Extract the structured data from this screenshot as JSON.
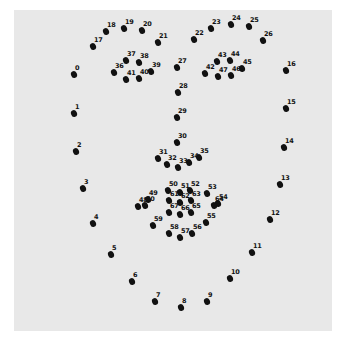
{
  "figure": {
    "background_color": "#ffffff",
    "panel_color": "#e8e8e8",
    "point_color": "#111111"
  },
  "landmarks": [
    {
      "id": "0",
      "x": 74,
      "y": 74
    },
    {
      "id": "1",
      "x": 74,
      "y": 113
    },
    {
      "id": "2",
      "x": 76,
      "y": 151
    },
    {
      "id": "3",
      "x": 83,
      "y": 188
    },
    {
      "id": "4",
      "x": 93,
      "y": 223
    },
    {
      "id": "5",
      "x": 111,
      "y": 254
    },
    {
      "id": "6",
      "x": 132,
      "y": 281
    },
    {
      "id": "7",
      "x": 155,
      "y": 301
    },
    {
      "id": "8",
      "x": 181,
      "y": 307
    },
    {
      "id": "9",
      "x": 207,
      "y": 301
    },
    {
      "id": "10",
      "x": 230,
      "y": 278
    },
    {
      "id": "11",
      "x": 252,
      "y": 252
    },
    {
      "id": "12",
      "x": 270,
      "y": 219
    },
    {
      "id": "13",
      "x": 280,
      "y": 184
    },
    {
      "id": "14",
      "x": 284,
      "y": 147
    },
    {
      "id": "15",
      "x": 286,
      "y": 108
    },
    {
      "id": "16",
      "x": 286,
      "y": 70
    },
    {
      "id": "17",
      "x": 93,
      "y": 46
    },
    {
      "id": "18",
      "x": 106,
      "y": 31
    },
    {
      "id": "19",
      "x": 124,
      "y": 28
    },
    {
      "id": "20",
      "x": 142,
      "y": 30
    },
    {
      "id": "21",
      "x": 158,
      "y": 42
    },
    {
      "id": "22",
      "x": 194,
      "y": 39
    },
    {
      "id": "23",
      "x": 211,
      "y": 28
    },
    {
      "id": "24",
      "x": 231,
      "y": 24
    },
    {
      "id": "25",
      "x": 249,
      "y": 26
    },
    {
      "id": "26",
      "x": 263,
      "y": 40
    },
    {
      "id": "27",
      "x": 177,
      "y": 67
    },
    {
      "id": "28",
      "x": 178,
      "y": 92
    },
    {
      "id": "29",
      "x": 177,
      "y": 117
    },
    {
      "id": "30",
      "x": 177,
      "y": 142
    },
    {
      "id": "31",
      "x": 158,
      "y": 158
    },
    {
      "id": "32",
      "x": 167,
      "y": 164
    },
    {
      "id": "33",
      "x": 178,
      "y": 167
    },
    {
      "id": "34",
      "x": 189,
      "y": 162
    },
    {
      "id": "35",
      "x": 199,
      "y": 157
    },
    {
      "id": "36",
      "x": 114,
      "y": 72
    },
    {
      "id": "37",
      "x": 126,
      "y": 60
    },
    {
      "id": "38",
      "x": 139,
      "y": 62
    },
    {
      "id": "39",
      "x": 151,
      "y": 71
    },
    {
      "id": "40",
      "x": 139,
      "y": 78
    },
    {
      "id": "41",
      "x": 126,
      "y": 79
    },
    {
      "id": "42",
      "x": 205,
      "y": 73
    },
    {
      "id": "43",
      "x": 217,
      "y": 61
    },
    {
      "id": "44",
      "x": 230,
      "y": 60
    },
    {
      "id": "45",
      "x": 242,
      "y": 68
    },
    {
      "id": "46",
      "x": 231,
      "y": 75
    },
    {
      "id": "47",
      "x": 218,
      "y": 76
    },
    {
      "id": "48",
      "x": 138,
      "y": 206
    },
    {
      "id": "49",
      "x": 148,
      "y": 199
    },
    {
      "id": "50",
      "x": 168,
      "y": 190
    },
    {
      "id": "51",
      "x": 180,
      "y": 192
    },
    {
      "id": "52",
      "x": 190,
      "y": 190
    },
    {
      "id": "53",
      "x": 207,
      "y": 193
    },
    {
      "id": "54",
      "x": 218,
      "y": 203
    },
    {
      "id": "55",
      "x": 206,
      "y": 222
    },
    {
      "id": "56",
      "x": 192,
      "y": 233
    },
    {
      "id": "57",
      "x": 180,
      "y": 237
    },
    {
      "id": "58",
      "x": 169,
      "y": 233
    },
    {
      "id": "59",
      "x": 153,
      "y": 225
    },
    {
      "id": "60",
      "x": 145,
      "y": 205
    },
    {
      "id": "61",
      "x": 169,
      "y": 200
    },
    {
      "id": "62",
      "x": 180,
      "y": 202
    },
    {
      "id": "63",
      "x": 191,
      "y": 200
    },
    {
      "id": "64",
      "x": 214,
      "y": 205
    },
    {
      "id": "65",
      "x": 191,
      "y": 212
    },
    {
      "id": "66",
      "x": 180,
      "y": 214
    },
    {
      "id": "67",
      "x": 169,
      "y": 212
    }
  ]
}
